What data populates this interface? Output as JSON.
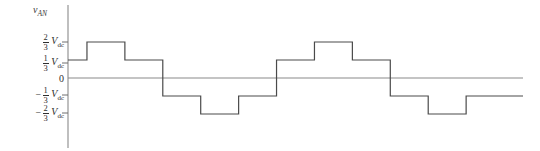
{
  "figure": {
    "background_color": "#ffffff",
    "trace_color": "#4a4a4a",
    "axis_color": "#8a8a8a",
    "text_color": "#2e2e2e"
  },
  "axis": {
    "y_label_main": "v",
    "y_label_sub": "AN",
    "zero_label": "0"
  },
  "ticks": [
    {
      "id": "tick-pos-two-thirds",
      "sign": "",
      "num": "2",
      "den": "3",
      "unit": "V",
      "unit_sub": "dc",
      "value": 0.6667
    },
    {
      "id": "tick-pos-one-third",
      "sign": "",
      "num": "1",
      "den": "3",
      "unit": "V",
      "unit_sub": "dc",
      "value": 0.3333
    },
    {
      "id": "tick-neg-one-third",
      "sign": "−",
      "num": "1",
      "den": "3",
      "unit": "V",
      "unit_sub": "dc",
      "value": -0.3333
    },
    {
      "id": "tick-neg-two-thirds",
      "sign": "−",
      "num": "2",
      "den": "3",
      "unit": "V",
      "unit_sub": "dc",
      "value": -0.6667
    }
  ],
  "chart_data": {
    "type": "line",
    "title": "",
    "xlabel": "",
    "ylabel": "v_AN",
    "subtype": "six-step-staircase-waveform",
    "ylim": [
      -1.0,
      1.0
    ],
    "xlim": [
      0,
      720
    ],
    "grid": false,
    "legend": null,
    "y_tick_values": [
      0.6667,
      0.3333,
      0,
      -0.3333,
      -0.6667
    ],
    "y_tick_labels": [
      "2/3 Vdc",
      "1/3 Vdc",
      "0",
      "-1/3 Vdc",
      "-2/3 Vdc"
    ],
    "series": [
      {
        "name": "v_AN",
        "style": "step-post",
        "color": "#4a4a4a",
        "x": [
          0,
          30,
          90,
          150,
          210,
          270,
          330,
          390,
          450,
          510,
          570,
          630,
          690,
          720
        ],
        "y": [
          0.3333,
          0.3333,
          0.6667,
          0.3333,
          -0.3333,
          -0.6667,
          -0.3333,
          0.3333,
          0.6667,
          0.3333,
          -0.3333,
          -0.6667,
          -0.3333,
          -0.3333
        ],
        "steps": [
          {
            "from_deg": 0,
            "to_deg": 30,
            "level": 0.3333
          },
          {
            "from_deg": 30,
            "to_deg": 90,
            "level": 0.6667
          },
          {
            "from_deg": 90,
            "to_deg": 150,
            "level": 0.3333
          },
          {
            "from_deg": 150,
            "to_deg": 210,
            "level": -0.3333
          },
          {
            "from_deg": 210,
            "to_deg": 270,
            "level": -0.6667
          },
          {
            "from_deg": 270,
            "to_deg": 330,
            "level": -0.3333
          },
          {
            "from_deg": 330,
            "to_deg": 390,
            "level": 0.3333
          },
          {
            "from_deg": 390,
            "to_deg": 450,
            "level": 0.6667
          },
          {
            "from_deg": 450,
            "to_deg": 510,
            "level": 0.3333
          },
          {
            "from_deg": 510,
            "to_deg": 570,
            "level": -0.3333
          },
          {
            "from_deg": 570,
            "to_deg": 630,
            "level": -0.6667
          },
          {
            "from_deg": 630,
            "to_deg": 690,
            "level": -0.3333
          }
        ]
      }
    ]
  }
}
